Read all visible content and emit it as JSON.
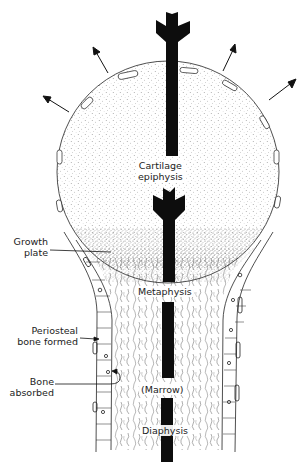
{
  "figure": {
    "type": "bone-growth-diagram",
    "colors": {
      "ink": "#111111",
      "stipple": "#555555",
      "background": "#ffffff"
    },
    "labels": {
      "cartilage_epiphysis": [
        "Cartilage",
        "epiphysis"
      ],
      "growth_plate": [
        "Growth",
        "plate"
      ],
      "metaphysis": "Metaphysis",
      "periosteal_bone_formed": [
        "Periosteal",
        "bone formed"
      ],
      "bone_absorbed": [
        "Bone",
        "absorbed"
      ],
      "marrow": "(Marrow)",
      "diaphysis": "Diaphysis"
    },
    "icons": {
      "growth_arrows": [
        "arrow-up-left-icon",
        "arrow-left-icon",
        "arrow-up-right-icon",
        "arrow-right-icon"
      ],
      "central_arrow": "fletched-arrow-icon"
    }
  }
}
